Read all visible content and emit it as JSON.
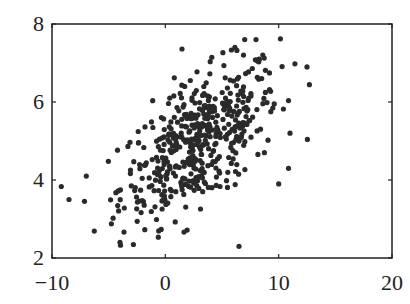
{
  "chart_data": {
    "type": "scatter",
    "title": "",
    "xlabel": "",
    "ylabel": "",
    "xlim": [
      -10,
      20
    ],
    "ylim": [
      2,
      8
    ],
    "x_ticks": [
      -10,
      0,
      10,
      20
    ],
    "x_tick_labels": [
      "−10",
      "0",
      "10",
      "20"
    ],
    "y_ticks": [
      2,
      4,
      6,
      8
    ],
    "y_tick_labels": [
      "2",
      "4",
      "6",
      "8"
    ],
    "grid": false,
    "legend": null,
    "marker_color": "#2a2a2a",
    "distribution": {
      "kind": "bivariate-normal-sample",
      "n": 500,
      "mean": [
        3,
        5
      ],
      "std": [
        3.5,
        1.0
      ],
      "correlation": 0.6
    },
    "notable_points": [
      {
        "x": -8.5,
        "y": 3.5
      },
      {
        "x": -4,
        "y": 2.4
      },
      {
        "x": 7,
        "y": 7.6
      },
      {
        "x": 8,
        "y": 7.6
      },
      {
        "x": 12.5,
        "y": 6.9
      },
      {
        "x": 11,
        "y": 5.2
      },
      {
        "x": 10,
        "y": 3.9
      },
      {
        "x": 6.5,
        "y": 2.3
      }
    ]
  }
}
